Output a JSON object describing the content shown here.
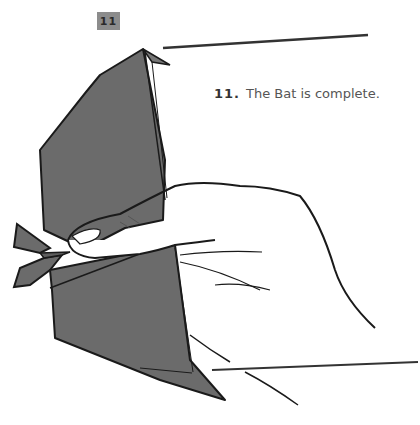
{
  "step_badge": {
    "label": "11"
  },
  "caption": {
    "number": "11.",
    "text": "The Bat is complete."
  },
  "illustration": {
    "subject": "origami-bat-held-in-hand",
    "paper_color": "#6b6b6b",
    "outline_color": "#1a1a1a"
  }
}
